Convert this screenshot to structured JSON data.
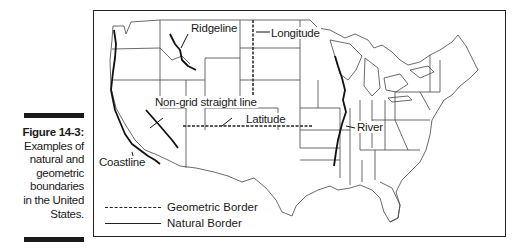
{
  "figure": {
    "number_label": "Figure 14-3:",
    "caption_lines": [
      "Examples of",
      "natural and",
      "geometric",
      "boundaries",
      "in the United",
      "States."
    ]
  },
  "map": {
    "subject": "Contiguous United States",
    "labels": {
      "ridgeline": "Ridgeline",
      "longitude": "Longitude",
      "non_grid": "Non-grid straight line",
      "latitude": "Latitude",
      "river": "River",
      "coastline": "Coastline"
    }
  },
  "legend": {
    "items": [
      {
        "style": "dashed",
        "label": "Geometric Border"
      },
      {
        "style": "solid",
        "label": "Natural Border"
      }
    ]
  }
}
